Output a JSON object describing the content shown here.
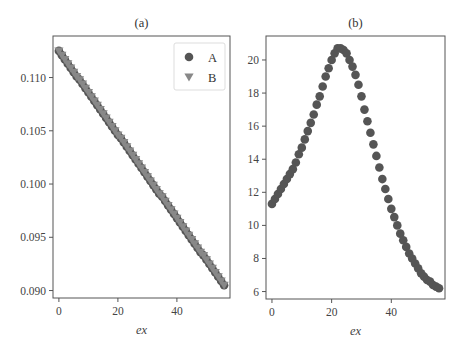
{
  "chart_data": [
    {
      "type": "scatter",
      "title": "(a)",
      "xlabel": "ex",
      "ylabel": "",
      "xlim": [
        -2,
        58
      ],
      "ylim": [
        0.0893,
        0.1139
      ],
      "xticks": [
        0,
        20,
        40
      ],
      "yticks": [
        0.09,
        0.095,
        0.1,
        0.105,
        0.11
      ],
      "ytick_labels": [
        "0.090",
        "0.095",
        "0.100",
        "0.105",
        "0.110"
      ],
      "grid": false,
      "legend": {
        "position": "upper right",
        "entries": [
          "A",
          "B"
        ]
      },
      "series": [
        {
          "name": "A",
          "marker": "circle",
          "color": "#555555",
          "x": [
            0,
            1,
            2,
            3,
            4,
            5,
            6,
            7,
            8,
            9,
            10,
            11,
            12,
            13,
            14,
            15,
            16,
            17,
            18,
            19,
            20,
            21,
            22,
            23,
            24,
            25,
            26,
            27,
            28,
            29,
            30,
            31,
            32,
            33,
            34,
            35,
            36,
            37,
            38,
            39,
            40,
            41,
            42,
            43,
            44,
            45,
            46,
            47,
            48,
            49,
            50,
            51,
            52,
            53,
            54,
            55,
            56
          ],
          "values": [
            0.1125,
            0.1121,
            0.1117,
            0.1113,
            0.1109,
            0.1105,
            0.1101,
            0.1098,
            0.1094,
            0.109,
            0.1086,
            0.1082,
            0.1078,
            0.1074,
            0.107,
            0.1066,
            0.1062,
            0.1058,
            0.1054,
            0.105,
            0.1046,
            0.1043,
            0.1039,
            0.1035,
            0.1031,
            0.1027,
            0.1023,
            0.1019,
            0.1015,
            0.1011,
            0.1007,
            0.1003,
            0.0999,
            0.0995,
            0.0991,
            0.0988,
            0.0984,
            0.098,
            0.0976,
            0.0972,
            0.0968,
            0.0964,
            0.096,
            0.0956,
            0.0952,
            0.0948,
            0.0944,
            0.094,
            0.0936,
            0.0933,
            0.0929,
            0.0925,
            0.0921,
            0.0917,
            0.0913,
            0.0909,
            0.0905
          ]
        },
        {
          "name": "B",
          "marker": "triangle-down",
          "color": "#888888",
          "x": [
            0,
            1,
            2,
            3,
            4,
            5,
            6,
            7,
            8,
            9,
            10,
            11,
            12,
            13,
            14,
            15,
            16,
            17,
            18,
            19,
            20,
            21,
            22,
            23,
            24,
            25,
            26,
            27,
            28,
            29,
            30,
            31,
            32,
            33,
            34,
            35,
            36,
            37,
            38,
            39,
            40,
            41,
            42,
            43,
            44,
            45,
            46,
            47,
            48,
            49,
            50,
            51,
            52,
            53,
            54,
            55,
            56
          ],
          "values": [
            0.1125,
            0.1121,
            0.1117,
            0.1113,
            0.1109,
            0.1105,
            0.1101,
            0.1098,
            0.1094,
            0.109,
            0.1086,
            0.1082,
            0.1078,
            0.1074,
            0.107,
            0.1066,
            0.1062,
            0.1058,
            0.1054,
            0.105,
            0.1046,
            0.1043,
            0.1039,
            0.1035,
            0.1031,
            0.1027,
            0.1023,
            0.1019,
            0.1015,
            0.1011,
            0.1007,
            0.1003,
            0.0999,
            0.0995,
            0.0991,
            0.0988,
            0.0984,
            0.098,
            0.0976,
            0.0972,
            0.0968,
            0.0964,
            0.096,
            0.0956,
            0.0952,
            0.0948,
            0.0944,
            0.094,
            0.0936,
            0.0933,
            0.0929,
            0.0925,
            0.0921,
            0.0917,
            0.0913,
            0.0909,
            0.0905
          ]
        }
      ]
    },
    {
      "type": "scatter",
      "title": "(b)",
      "xlabel": "ex",
      "ylabel": "",
      "xlim": [
        -2,
        58
      ],
      "ylim": [
        5.55,
        21.45
      ],
      "xticks": [
        0,
        20,
        40
      ],
      "yticks": [
        6,
        8,
        10,
        12,
        14,
        16,
        18,
        20
      ],
      "ytick_labels": [
        "6",
        "8",
        "10",
        "12",
        "14",
        "16",
        "18",
        "20"
      ],
      "grid": false,
      "series": [
        {
          "name": "A",
          "marker": "circle",
          "color": "#555555",
          "x": [
            0,
            1,
            2,
            3,
            4,
            5,
            6,
            7,
            8,
            9,
            10,
            11,
            12,
            13,
            14,
            15,
            16,
            17,
            18,
            19,
            20,
            21,
            22,
            23,
            24,
            25,
            26,
            27,
            28,
            29,
            30,
            31,
            32,
            33,
            34,
            35,
            36,
            37,
            38,
            39,
            40,
            41,
            42,
            43,
            44,
            45,
            46,
            47,
            48,
            49,
            50,
            51,
            52,
            53,
            54,
            55,
            56
          ],
          "values": [
            11.3,
            11.6,
            11.9,
            12.2,
            12.5,
            12.8,
            13.1,
            13.4,
            13.8,
            14.3,
            14.7,
            15.2,
            15.7,
            16.2,
            16.7,
            17.3,
            17.8,
            18.4,
            19.0,
            19.5,
            20.0,
            20.4,
            20.7,
            20.7,
            20.6,
            20.4,
            20.0,
            19.6,
            19.1,
            18.5,
            17.8,
            17.0,
            16.3,
            15.6,
            14.9,
            14.2,
            13.5,
            12.8,
            12.2,
            11.6,
            11.0,
            10.5,
            10.0,
            9.5,
            9.1,
            8.7,
            8.3,
            8.0,
            7.7,
            7.4,
            7.1,
            6.9,
            6.7,
            6.6,
            6.4,
            6.3,
            6.2
          ]
        }
      ]
    }
  ]
}
